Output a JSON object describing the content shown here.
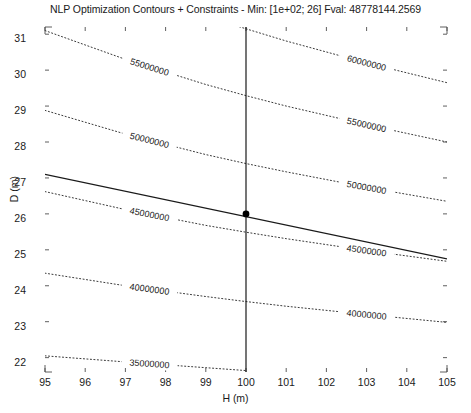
{
  "chart_data": {
    "type": "line",
    "title": "NLP Optimization Contours + Constraints - Min: [1e+02; 26] Fval: 48778144.2569",
    "xlabel": "H (m)",
    "ylabel": "D (m)",
    "xlim": [
      95,
      105
    ],
    "ylim": [
      21.6,
      31.2
    ],
    "xticks": [
      95,
      96,
      97,
      98,
      99,
      100,
      101,
      102,
      103,
      104,
      105
    ],
    "yticks": [
      22,
      23,
      24,
      25,
      26,
      27,
      28,
      29,
      30,
      31
    ],
    "grid": false,
    "legend": "none",
    "contour_levels": [
      35000000,
      40000000,
      45000000,
      50000000,
      55000000,
      60000000,
      65000000
    ],
    "contour_label_text": {
      "l35": "35000000",
      "l40": "40000000",
      "l45": "45000000",
      "l50": "50000000",
      "l55": "55000000",
      "l60": "60000000",
      "l65": "65000000"
    },
    "contours": [
      {
        "level": 35000000,
        "label": "35000000",
        "points": [
          [
            95,
            22.05
          ],
          [
            97,
            21.88
          ],
          [
            99,
            21.72
          ],
          [
            100,
            21.64
          ]
        ]
      },
      {
        "level": 40000000,
        "label": "40000000",
        "points": [
          [
            95,
            24.35
          ],
          [
            97,
            24.0
          ],
          [
            99,
            23.7
          ],
          [
            100,
            23.56
          ],
          [
            101,
            23.43
          ],
          [
            103,
            23.2
          ],
          [
            105,
            22.98
          ]
        ]
      },
      {
        "level": 45000000,
        "label": "45000000",
        "points": [
          [
            95,
            26.62
          ],
          [
            97,
            26.12
          ],
          [
            99,
            25.68
          ],
          [
            100,
            25.49
          ],
          [
            101,
            25.31
          ],
          [
            103,
            24.98
          ],
          [
            105,
            24.68
          ]
        ]
      },
      {
        "level": 50000000,
        "label": "50000000",
        "points": [
          [
            95,
            28.88
          ],
          [
            97,
            28.22
          ],
          [
            99,
            27.65
          ],
          [
            100,
            27.4
          ],
          [
            101,
            27.17
          ],
          [
            103,
            26.74
          ],
          [
            105,
            26.35
          ]
        ]
      },
      {
        "level": 55000000,
        "label": "55000000",
        "points": [
          [
            95,
            31.1
          ],
          [
            97,
            30.3
          ],
          [
            99,
            29.6
          ],
          [
            100,
            29.29
          ],
          [
            101,
            29.0
          ],
          [
            103,
            28.48
          ],
          [
            105,
            28.0
          ]
        ]
      },
      {
        "level": 60000000,
        "label": "60000000",
        "points": [
          [
            95.6,
            33.2
          ],
          [
            97,
            32.3
          ],
          [
            99,
            31.5
          ],
          [
            100,
            31.15
          ],
          [
            101,
            30.81
          ],
          [
            103,
            30.2
          ],
          [
            105,
            29.65
          ]
        ]
      },
      {
        "level": 65000000,
        "label": "65000000",
        "points": [
          [
            98.4,
            34.0
          ],
          [
            100,
            32.95
          ],
          [
            101,
            32.57
          ],
          [
            103,
            31.88
          ],
          [
            105,
            31.26
          ]
        ]
      }
    ],
    "constraint_lines": [
      {
        "name": "equality-constraint-line",
        "style": "solid",
        "points": [
          [
            95,
            27.1
          ],
          [
            105,
            24.75
          ]
        ]
      },
      {
        "name": "vertical-constraint-line",
        "style": "solid",
        "points": [
          [
            100,
            21.6
          ],
          [
            100,
            31.2
          ]
        ]
      }
    ],
    "minimum_marker": {
      "x": 100,
      "y": 26,
      "label": "[1e+02; 26]",
      "fval": 48778144.2569
    },
    "colors": {
      "contour": "#3a3a3a",
      "constraint": "#1a1a1a",
      "axis": "#4d4d4d",
      "marker": "#000000",
      "background": "#ffffff"
    }
  },
  "axes": {
    "x_tick_labels": [
      "95",
      "96",
      "97",
      "98",
      "99",
      "100",
      "101",
      "102",
      "103",
      "104",
      "105"
    ],
    "y_tick_labels": [
      "22",
      "23",
      "24",
      "25",
      "26",
      "27",
      "28",
      "29",
      "30",
      "31"
    ]
  }
}
